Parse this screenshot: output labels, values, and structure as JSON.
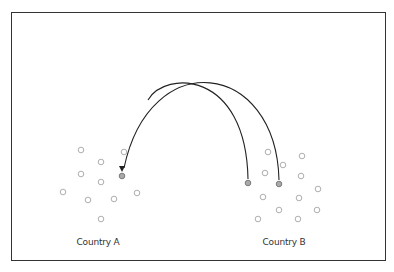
{
  "diagram": {
    "type": "migration-flow",
    "colors": {
      "stroke": "#222222",
      "circle": "#999999",
      "highlight_fill": "#aaaaaa",
      "border": "#333333"
    },
    "countries": [
      {
        "label": "Country A",
        "label_x": 98,
        "people": [
          {
            "x": 81,
            "y": 150
          },
          {
            "x": 124,
            "y": 152
          },
          {
            "x": 101,
            "y": 162
          },
          {
            "x": 81,
            "y": 174
          },
          {
            "x": 122,
            "y": 176,
            "highlight": true
          },
          {
            "x": 101,
            "y": 182
          },
          {
            "x": 63,
            "y": 192
          },
          {
            "x": 137,
            "y": 193
          },
          {
            "x": 88,
            "y": 200
          },
          {
            "x": 114,
            "y": 199
          },
          {
            "x": 101,
            "y": 219
          }
        ]
      },
      {
        "label": "Country B",
        "label_x": 284,
        "people": [
          {
            "x": 268,
            "y": 152
          },
          {
            "x": 302,
            "y": 156
          },
          {
            "x": 283,
            "y": 165
          },
          {
            "x": 265,
            "y": 173
          },
          {
            "x": 301,
            "y": 176
          },
          {
            "x": 248,
            "y": 183,
            "highlight": true
          },
          {
            "x": 279,
            "y": 184,
            "highlight": true
          },
          {
            "x": 318,
            "y": 189
          },
          {
            "x": 263,
            "y": 197
          },
          {
            "x": 299,
            "y": 198
          },
          {
            "x": 279,
            "y": 210
          },
          {
            "x": 317,
            "y": 210
          },
          {
            "x": 258,
            "y": 219
          },
          {
            "x": 298,
            "y": 219
          }
        ]
      }
    ],
    "arcs": [
      {
        "name": "outer-arc",
        "path": "M 279 180 C 276 60, 150 45, 124 168"
      },
      {
        "name": "inner-arc",
        "path": "M 248 179 C 246 70, 165 70, 148 100"
      }
    ],
    "arrow_tip": {
      "x": 122,
      "y": 172
    }
  }
}
